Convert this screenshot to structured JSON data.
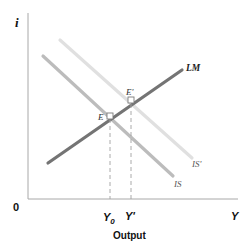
{
  "diagram": {
    "type": "IS-LM shift",
    "axes": {
      "y_label": "i",
      "x_label": "Y",
      "origin_label": "0",
      "x_title": "Output"
    },
    "curves": [
      {
        "id": "LM",
        "label": "LM",
        "color": "#6e6e6e"
      },
      {
        "id": "IS",
        "label": "IS",
        "color": "#bdbdbd"
      },
      {
        "id": "IS_prime",
        "label": "IS'",
        "color": "#e2e2e2"
      }
    ],
    "points": [
      {
        "id": "E",
        "label": "E"
      },
      {
        "id": "E_prime",
        "label": "E'"
      }
    ],
    "x_ticks": [
      {
        "id": "Y0",
        "label": "Y",
        "subscript": "0"
      },
      {
        "id": "Y_prime",
        "label": "Y'"
      }
    ],
    "colors": {
      "axis": "#9a9a9a",
      "dash": "#a0a0a0",
      "text": "#222222",
      "curve_label": "#333333"
    }
  }
}
